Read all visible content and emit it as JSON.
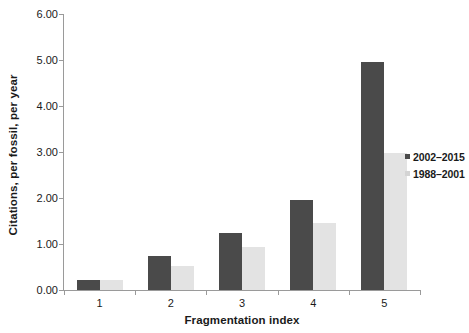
{
  "chart_data": {
    "type": "bar",
    "title": "",
    "xlabel": "Fragmentation index",
    "ylabel": "Citations, per fossil, per year",
    "categories": [
      "1",
      "2",
      "3",
      "4",
      "5"
    ],
    "series": [
      {
        "name": "2002–2015",
        "color": "#4a4a4a",
        "values": [
          0.21,
          0.73,
          1.24,
          1.96,
          4.95
        ]
      },
      {
        "name": "1988–2001",
        "color": "#e3e3e3",
        "values": [
          0.22,
          0.52,
          0.93,
          1.46,
          2.98
        ]
      }
    ],
    "ylim": [
      0,
      6
    ],
    "ytick_values": [
      0,
      1,
      2,
      3,
      4,
      5,
      6
    ],
    "ytick_labels": [
      "0.00",
      "1.00",
      "2.00",
      "3.00",
      "4.00",
      "5.00",
      "6.00"
    ],
    "grid": false,
    "legend_position": "right-middle"
  },
  "legend": {
    "items": [
      {
        "label": "2002–2015",
        "marker": "square-marker-dark"
      },
      {
        "label": "1988–2001",
        "marker": "square-marker-light"
      }
    ]
  },
  "axes": {
    "x_label": "Fragmentation index",
    "y_label": "Citations, per fossil, per year"
  }
}
